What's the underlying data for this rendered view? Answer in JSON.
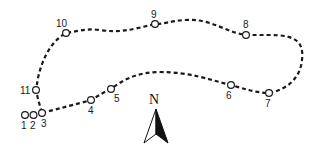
{
  "diagram": {
    "type": "route-map",
    "colors": {
      "line": "#1a1a1a",
      "background": "#ffffff"
    },
    "stations": [
      {
        "id": "1",
        "label": "1"
      },
      {
        "id": "2",
        "label": "2"
      },
      {
        "id": "3",
        "label": "3"
      },
      {
        "id": "4",
        "label": "4"
      },
      {
        "id": "5",
        "label": "5"
      },
      {
        "id": "6",
        "label": "6"
      },
      {
        "id": "7",
        "label": "7"
      },
      {
        "id": "8",
        "label": "8"
      },
      {
        "id": "9",
        "label": "9"
      },
      {
        "id": "10",
        "label": "10"
      },
      {
        "id": "11",
        "label": "11"
      }
    ],
    "compass": {
      "label": "N",
      "icon": "north-arrow-icon"
    }
  }
}
